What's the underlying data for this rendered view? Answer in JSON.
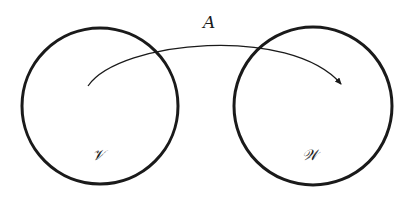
{
  "diagram": {
    "type": "mapping",
    "colors": {
      "stroke": "#1a1a1a",
      "background": "#ffffff"
    },
    "nodes": [
      {
        "id": "V",
        "label": "𝒱",
        "cx": 100,
        "cy": 106,
        "r": 78
      },
      {
        "id": "W",
        "label": "𝒲",
        "cx": 313,
        "cy": 106,
        "r": 79
      }
    ],
    "edges": [
      {
        "from": "V",
        "to": "W",
        "label": "A"
      }
    ]
  },
  "labels": {
    "arrow": "A",
    "domain": "𝒱",
    "codomain": "𝒲"
  }
}
